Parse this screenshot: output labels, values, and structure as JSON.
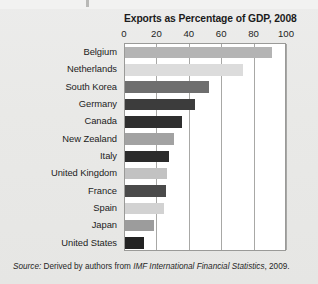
{
  "chart_data": {
    "type": "bar",
    "orientation": "horizontal",
    "title": "Exports as Percentage of GDP, 2008",
    "xlabel": "",
    "ylabel": "",
    "xlim": [
      0,
      100
    ],
    "xticks": [
      0,
      20,
      40,
      60,
      80,
      100
    ],
    "grid": true,
    "legend": "none",
    "categories": [
      "Belgium",
      "Netherlands",
      "South Korea",
      "Germany",
      "Canada",
      "New Zealand",
      "Italy",
      "United Kingdom",
      "France",
      "Spain",
      "Japan",
      "United States"
    ],
    "values": [
      91,
      73,
      52,
      43,
      35,
      30,
      27,
      26,
      25,
      24,
      18,
      12
    ],
    "bar_colors": [
      "#b4b4b4",
      "#dcdcdc",
      "#6e6e6e",
      "#3c3c3c",
      "#2e2e2e",
      "#a2a2a2",
      "#2b2b2b",
      "#c2c2c2",
      "#4a4a4a",
      "#d2d2d2",
      "#9c9c9c",
      "#232323"
    ]
  },
  "source": {
    "label": "Source:",
    "text_before": " Derived by authors from ",
    "publication": "IMF International Financial Statistics",
    "text_after": ", 2009."
  }
}
